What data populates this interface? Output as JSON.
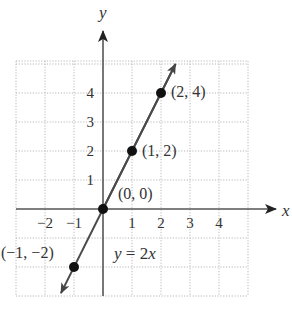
{
  "chart_data": {
    "type": "line",
    "title": "",
    "xlabel": "x",
    "ylabel": "y",
    "equation": "y = 2x",
    "xlim": [
      -3,
      5
    ],
    "ylim": [
      -3,
      5
    ],
    "grid": true,
    "x_ticks": [
      -2,
      -1,
      1,
      2,
      3,
      4
    ],
    "x_tick_labels": [
      "−2",
      "−1",
      "1",
      "2",
      "3",
      "4"
    ],
    "y_ticks": [
      1,
      2,
      3,
      4
    ],
    "y_tick_labels": [
      "1",
      "2",
      "3",
      "4"
    ],
    "series": [
      {
        "name": "y = 2x",
        "slope": 2,
        "intercept": 0,
        "line_x_range": [
          -1.45,
          2.5
        ],
        "points": [
          {
            "x": -1,
            "y": -2,
            "label": "(−1, −2)"
          },
          {
            "x": 0,
            "y": 0,
            "label": "(0, 0)"
          },
          {
            "x": 1,
            "y": 2,
            "label": "(1, 2)"
          },
          {
            "x": 2,
            "y": 4,
            "label": "(2, 4)"
          }
        ]
      }
    ],
    "colors": {
      "line": "#4a4a4a",
      "axis": "#555555",
      "point": "#111111",
      "grid": "#b8b8b8",
      "text": "#333333"
    }
  }
}
